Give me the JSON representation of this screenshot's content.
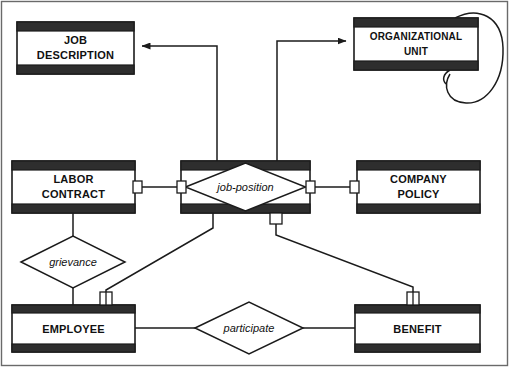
{
  "diagram": {
    "type": "entity-relationship",
    "colors": {
      "stroke": "#1b1b1b",
      "header_bar": "#2e2e2e",
      "background": "#ffffff",
      "frame": "#6a6a6a"
    },
    "entities": [
      {
        "id": "job-description",
        "line1": "JOB",
        "line2": "DESCRIPTION",
        "x": 17,
        "y": 22,
        "w": 117,
        "h": 52
      },
      {
        "id": "organizational-unit",
        "line1": "ORGANIZATIONAL",
        "line2": "UNIT",
        "x": 354,
        "y": 18,
        "w": 124,
        "h": 52,
        "self_loop": true
      },
      {
        "id": "labor-contract",
        "line1": "LABOR",
        "line2": "CONTRACT",
        "x": 12,
        "y": 161,
        "w": 123,
        "h": 52
      },
      {
        "id": "company-policy",
        "line1": "COMPANY",
        "line2": "POLICY",
        "x": 357,
        "y": 161,
        "w": 123,
        "h": 52
      },
      {
        "id": "employee",
        "line1": "EMPLOYEE",
        "line2": "",
        "x": 12,
        "y": 305,
        "w": 123,
        "h": 47
      },
      {
        "id": "benefit",
        "line1": "BENEFIT",
        "line2": "",
        "x": 355,
        "y": 305,
        "w": 125,
        "h": 47
      }
    ],
    "associative_entities": [
      {
        "id": "job-position",
        "label": "job-position",
        "x": 181,
        "y": 161,
        "w": 129,
        "h": 52
      }
    ],
    "relationships": [
      {
        "id": "grievance",
        "label": "grievance",
        "cx": 73,
        "cy": 262,
        "rx": 52,
        "ry": 26
      },
      {
        "id": "participate",
        "label": "participate",
        "cx": 249,
        "cy": 328,
        "rx": 54,
        "ry": 26
      }
    ],
    "connections": [
      {
        "id": "job-position-to-job-description",
        "from": "job-position",
        "to": "job-description",
        "arrow": true
      },
      {
        "id": "job-position-to-organizational-unit",
        "from": "job-position",
        "to": "organizational-unit",
        "arrow": true
      },
      {
        "id": "labor-contract-to-job-position",
        "from": "labor-contract",
        "to": "job-position",
        "arrow": false
      },
      {
        "id": "job-position-to-company-policy",
        "from": "job-position",
        "to": "company-policy",
        "arrow": false
      },
      {
        "id": "labor-contract-to-grievance",
        "from": "labor-contract",
        "to": "grievance",
        "arrow": false
      },
      {
        "id": "grievance-to-employee",
        "from": "grievance",
        "to": "employee",
        "arrow": false
      },
      {
        "id": "job-position-to-employee",
        "from": "job-position",
        "to": "employee",
        "arrow": false
      },
      {
        "id": "job-position-to-benefit",
        "from": "job-position",
        "to": "benefit",
        "arrow": false
      },
      {
        "id": "employee-to-participate",
        "from": "employee",
        "to": "participate",
        "arrow": false
      },
      {
        "id": "participate-to-benefit",
        "from": "participate",
        "to": "benefit",
        "arrow": false
      },
      {
        "id": "organizational-unit-self-loop",
        "from": "organizational-unit",
        "to": "organizational-unit",
        "arrow": false
      }
    ]
  }
}
